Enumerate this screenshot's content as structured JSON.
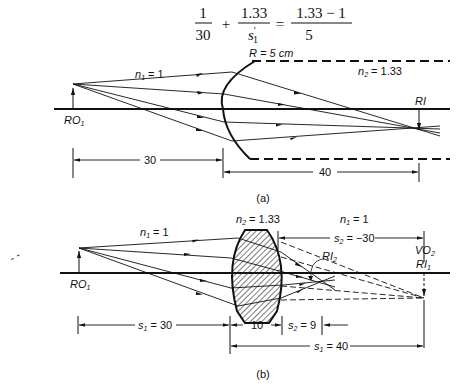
{
  "equation": {
    "term1_num": "1",
    "term1_den": "30",
    "plus": "+",
    "term2_num": "1.33",
    "term2_den_var": "s",
    "term2_den_prime": "′",
    "term2_den_sub": "1",
    "equals": "=",
    "rhs_num": "1.33 − 1",
    "rhs_den": "5"
  },
  "figure_a": {
    "caption": "(a)",
    "n1_label": "n",
    "n1_sub": "1",
    "n1_value": " = 1",
    "n2_label": "n",
    "n2_sub": "2",
    "n2_value": " = 1.33",
    "radius_label": "R = 5 cm",
    "object_label": "RO",
    "object_sub": "1",
    "image_label": "RI",
    "dim_object": "30",
    "dim_image": "40"
  },
  "figure_b": {
    "caption": "(b)",
    "n1_label": "n",
    "n1_sub": "1",
    "n1_value": " = 1",
    "n2_label": "n",
    "n2_sub": "2",
    "n2_value": " = 1.33",
    "n1_right_label": "n",
    "n1_right_sub": "1",
    "n1_right_value": " = 1",
    "object_label": "RO",
    "object_sub": "1",
    "ri2_label": "RI",
    "ri2_sub": "2",
    "vo2_label": "VO",
    "vo2_sub": "2",
    "ri1_label": "RI",
    "ri1_sub": "1",
    "s2_label": "s",
    "s2_sub": "2",
    "s2_value": " = −30",
    "s1_label": "s",
    "s1_sub": "1",
    "s1_value": " = 30",
    "thickness": "10",
    "s2p_label": "s",
    "s2p_sub": "2",
    "s2p_value": " = 9",
    "s1p_label": "s",
    "s1p_sub": "1",
    "s1p_value": " = 40"
  }
}
